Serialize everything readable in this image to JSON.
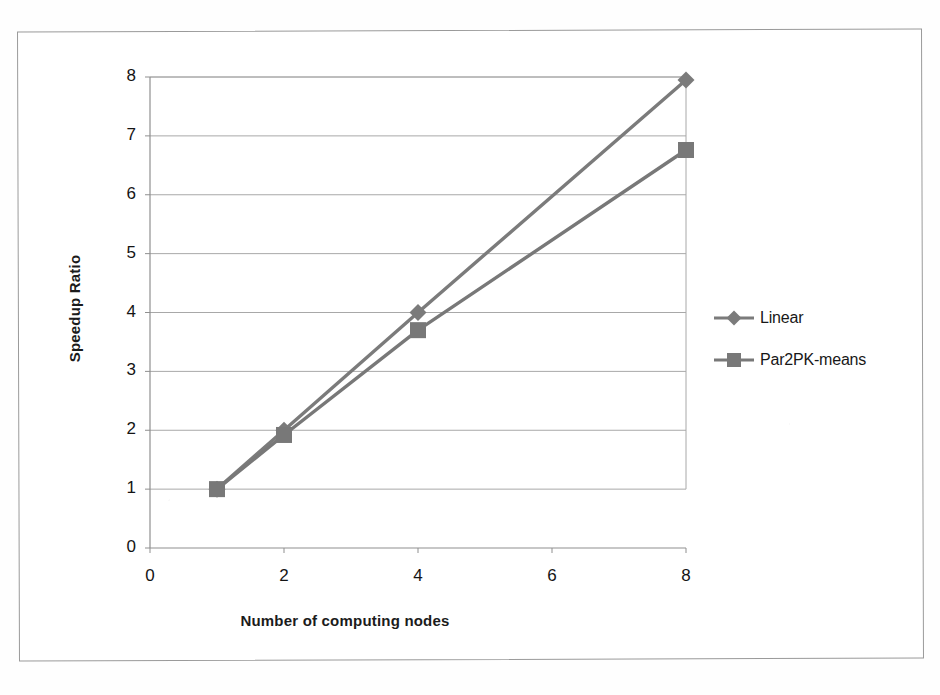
{
  "chart_data": {
    "type": "line",
    "title": "",
    "subtitle": "",
    "xlabel": "Number of computing nodes",
    "ylabel": "Speedup Ratio",
    "x": [
      1,
      2,
      4,
      8
    ],
    "xlim": [
      0,
      8
    ],
    "ylim": [
      0,
      8
    ],
    "xticks": [
      "0",
      "2",
      "4",
      "6",
      "8"
    ],
    "xtick_values": [
      0,
      2,
      4,
      6,
      8
    ],
    "yticks": [
      "0",
      "1",
      "2",
      "3",
      "4",
      "5",
      "6",
      "7",
      "8"
    ],
    "ytick_values": [
      0,
      1,
      2,
      3,
      4,
      5,
      6,
      7,
      8
    ],
    "grid": "horizontal",
    "legend_position": "right",
    "series": [
      {
        "name": "Linear",
        "marker": "diamond",
        "color": "#7b7b7b",
        "values": [
          1.0,
          2.0,
          4.0,
          7.95
        ]
      },
      {
        "name": "Par2PK-means",
        "marker": "square",
        "color": "#787878",
        "values": [
          1.0,
          1.92,
          3.7,
          6.76
        ]
      }
    ]
  },
  "figure": {
    "frame_color": "#9a9a9a",
    "background_color": "#ffffff",
    "gridline_color": "#a8a8a8",
    "axis_color": "#8f8f8f",
    "text_color": "#141414"
  },
  "axes": {
    "x_title": "Number of computing nodes",
    "y_title": "Speedup Ratio"
  },
  "legend": {
    "items": [
      {
        "label": "Linear",
        "marker": "diamond-marker",
        "color": "#7b7b7b"
      },
      {
        "label": "Par2PK-means",
        "marker": "square-marker",
        "color": "#787878"
      }
    ]
  }
}
